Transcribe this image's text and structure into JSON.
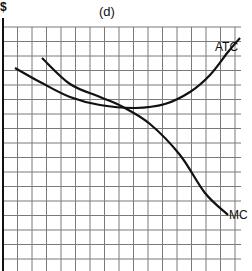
{
  "chart_data": {
    "type": "line",
    "title": "(d)",
    "xlabel": "",
    "ylabel": "$",
    "grid": true,
    "grid_spacing_px": 14.5,
    "tick_labels": [],
    "legend": null,
    "annotations": [
      "ATC",
      "MC"
    ],
    "series": [
      {
        "name": "ATC",
        "shape": "U-shaped",
        "points_px": [
          [
            15,
            68
          ],
          [
            40,
            82
          ],
          [
            70,
            97
          ],
          [
            100,
            105
          ],
          [
            135,
            108
          ],
          [
            165,
            104
          ],
          [
            190,
            92
          ],
          [
            210,
            75
          ],
          [
            228,
            52
          ],
          [
            240,
            38
          ]
        ]
      },
      {
        "name": "MC",
        "shape": "downward sloping, crosses ATC at its minimum",
        "points_px": [
          [
            42,
            58
          ],
          [
            70,
            84
          ],
          [
            100,
            97
          ],
          [
            123,
            107
          ],
          [
            150,
            124
          ],
          [
            180,
            155
          ],
          [
            205,
            193
          ],
          [
            228,
            215
          ]
        ]
      }
    ]
  },
  "labels": {
    "title": "(d)",
    "y_axis": "$",
    "atc": "ATC",
    "mc": "MC"
  },
  "colors": {
    "curve": "#111111",
    "grid": "#7a7a7a",
    "axis": "#111111",
    "background": "#ffffff"
  }
}
